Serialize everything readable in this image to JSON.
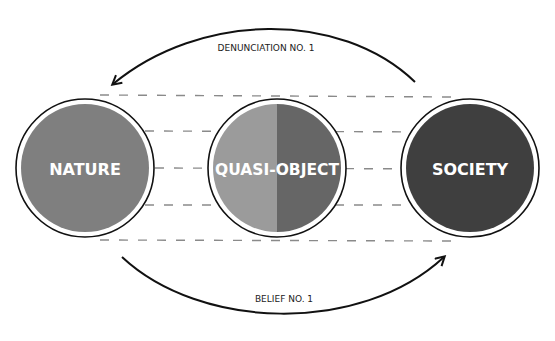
{
  "diagram": {
    "colors": {
      "background": "#ffffff",
      "dash_line": "#8a8a8a",
      "ring_stroke": "#111111",
      "arrow_stroke": "#111111",
      "label_text": "#ffffff",
      "arrow_label_text": "#222222"
    },
    "nodes": [
      {
        "id": "nature",
        "label": "NATURE",
        "fill": "#7f7f7f"
      },
      {
        "id": "quasi_object",
        "label": "QUASI-OBJECT",
        "fill_left": "#9b9b9b",
        "fill_right": "#666666"
      },
      {
        "id": "society",
        "label": "SOCIETY",
        "fill": "#3f3f3f"
      }
    ],
    "arrows": {
      "top": {
        "label": "DENUNCIATION NO. 1",
        "from": "society",
        "to": "nature"
      },
      "bottom": {
        "label": "BELIEF NO. 1",
        "from": "nature",
        "to": "society"
      }
    },
    "dashed_lines_count": 5
  }
}
